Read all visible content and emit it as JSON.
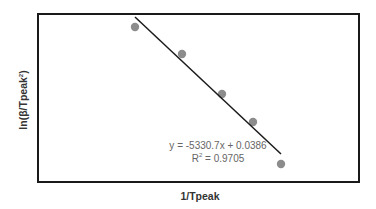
{
  "chart_data": {
    "type": "scatter",
    "title": "",
    "xlabel": "1/Tpeak",
    "ylabel": "ln(β/Tpeak²)",
    "grid": false,
    "legend": null,
    "points_pixel": [
      [
        135,
        27
      ],
      [
        182,
        54
      ],
      [
        222,
        94
      ],
      [
        253,
        122
      ],
      [
        281,
        164
      ]
    ],
    "trendline": {
      "type": "linear",
      "equation": "y = -5330.7x + 0.0386",
      "r2_label": "R² = 0.9705",
      "slope": -5330.7,
      "intercept": 0.0386,
      "r2": 0.9705,
      "pixel_start": [
        135,
        17
      ],
      "pixel_end": [
        281,
        154
      ]
    },
    "colors": {
      "marker": "#8c8c8c",
      "line": "#1a1a1a",
      "frame": "#1a1a1a"
    }
  },
  "labels": {
    "x": "1/Tpeak",
    "y_main": "ln(β/Tpeak",
    "y_sup": "2",
    "y_close": ")",
    "equation": "y = -5330.7x + 0.0386",
    "r2_prefix": "R",
    "r2_sup": "2",
    "r2_value": " = 0.9705"
  }
}
